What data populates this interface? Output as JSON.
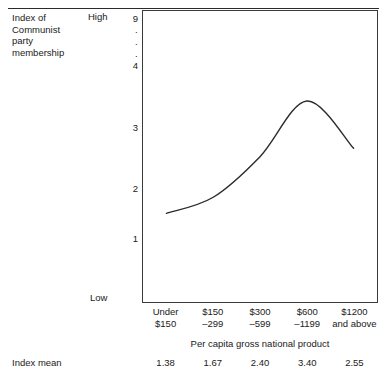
{
  "figure": {
    "y_axis_caption_lines": [
      "Index of",
      "Communist",
      "party",
      "membership"
    ],
    "high_label": "High",
    "low_label": "Low",
    "mean_row_label": "Index mean"
  },
  "chart_data": {
    "type": "line",
    "title": "",
    "xlabel": "Per capita gross national product",
    "ylabel": "Index of Communist party membership",
    "categories": [
      "Under $150",
      "$150 -299",
      "$300 -599",
      "$600 -1199",
      "$1200 and above"
    ],
    "category_lines": [
      [
        "Under",
        "$150"
      ],
      [
        "$150",
        "–299"
      ],
      [
        "$300",
        "–599"
      ],
      [
        "$600",
        "–1199"
      ],
      [
        "$1200",
        "and above"
      ]
    ],
    "values": [
      1.38,
      1.67,
      2.4,
      3.4,
      2.55
    ],
    "index_means": [
      "1.38",
      "1.67",
      "2.40",
      "3.40",
      "2.55"
    ],
    "ytick_labels": [
      "9",
      "4",
      "3",
      "2",
      "1"
    ],
    "ytick_values": [
      9,
      4,
      3,
      2,
      1
    ],
    "y_axis_break_marker": "·",
    "ylim": [
      0,
      4.6
    ],
    "grid": false,
    "legend": "none",
    "high_low_scale": [
      "High",
      "Low"
    ],
    "line_color": "#2b2b2b"
  }
}
